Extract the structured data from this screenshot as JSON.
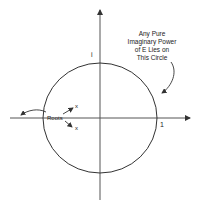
{
  "diagram": {
    "annotation_lines": [
      "Any Pure",
      "Imaginary Power",
      "of E Lies on",
      "This Circle"
    ],
    "label_i": "i",
    "label_one": "1",
    "label_roots": "Roots",
    "label_x_upper": "x",
    "label_x_lower": "x",
    "colors": {
      "stroke": "#333333",
      "text": "#222222",
      "background": "#ffffff"
    }
  }
}
